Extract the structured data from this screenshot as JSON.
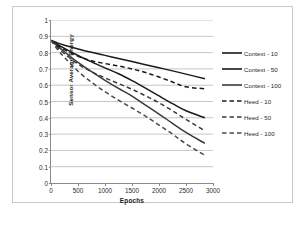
{
  "chart_data": {
    "type": "line",
    "title": "",
    "xlabel": "Epochs",
    "ylabel": "Sensor Average Energy",
    "xlim": [
      0,
      3000
    ],
    "ylim": [
      0,
      1
    ],
    "xticks": [
      "0",
      "500",
      "1000",
      "1500",
      "2000",
      "2500",
      "3000"
    ],
    "yticks": [
      "0",
      "0.1",
      "0.2",
      "0.3",
      "0.4",
      "0.5",
      "0.6",
      "0.7",
      "0.8",
      "0.9",
      "1"
    ],
    "grid": "horizontal",
    "legend_position": "right",
    "x": [
      0,
      100,
      250,
      500,
      750,
      1000,
      1250,
      1500,
      1750,
      2000,
      2250,
      2500,
      2850
    ],
    "series": [
      {
        "name": "Context - 10",
        "style": "solid",
        "color": "#1a1a1a",
        "values": [
          0.875,
          0.862,
          0.845,
          0.822,
          0.802,
          0.783,
          0.764,
          0.745,
          0.726,
          0.707,
          0.688,
          0.668,
          0.64
        ]
      },
      {
        "name": "Context - 50",
        "style": "solid",
        "color": "#1a1a1a",
        "values": [
          0.875,
          0.855,
          0.826,
          0.782,
          0.743,
          0.706,
          0.67,
          0.628,
          0.582,
          0.534,
          0.487,
          0.443,
          0.4
        ]
      },
      {
        "name": "Context - 100",
        "style": "solid",
        "color": "#3a3a3a",
        "values": [
          0.875,
          0.846,
          0.805,
          0.74,
          0.683,
          0.63,
          0.58,
          0.533,
          0.478,
          0.423,
          0.366,
          0.31,
          0.243
        ]
      },
      {
        "name": "Heed - 10",
        "style": "dashed",
        "color": "#1a1a1a",
        "values": [
          0.875,
          0.848,
          0.818,
          0.778,
          0.75,
          0.733,
          0.718,
          0.7,
          0.678,
          0.65,
          0.62,
          0.59,
          0.578
        ]
      },
      {
        "name": "Heed - 50",
        "style": "dashed",
        "color": "#3a3a3a",
        "values": [
          0.875,
          0.838,
          0.793,
          0.73,
          0.683,
          0.645,
          0.61,
          0.575,
          0.535,
          0.492,
          0.443,
          0.39,
          0.32
        ]
      },
      {
        "name": "Heed - 100",
        "style": "dashed",
        "color": "#4a4a4a",
        "values": [
          0.875,
          0.828,
          0.77,
          0.686,
          0.618,
          0.56,
          0.508,
          0.46,
          0.41,
          0.355,
          0.3,
          0.24,
          0.17
        ]
      }
    ]
  },
  "legend": {
    "items": [
      {
        "label": "Context - 10"
      },
      {
        "label": "Context - 50"
      },
      {
        "label": "Context - 100"
      },
      {
        "label": "Heed - 10"
      },
      {
        "label": "Heed - 50"
      },
      {
        "label": "Heed - 100"
      }
    ]
  }
}
